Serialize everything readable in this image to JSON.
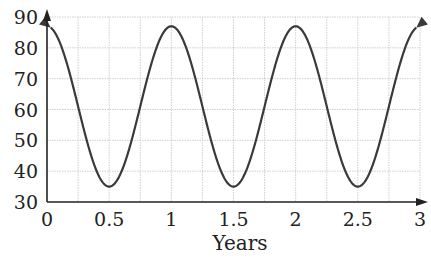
{
  "chart_data": {
    "type": "line",
    "title": "",
    "xlabel": "Years",
    "ylabel": "",
    "xlim": [
      0,
      3
    ],
    "ylim": [
      30,
      90
    ],
    "x_ticks": [
      "0",
      "0.5",
      "1",
      "1.5",
      "2",
      "2.5",
      "3"
    ],
    "y_ticks": [
      "30",
      "40",
      "50",
      "60",
      "70",
      "80",
      "90"
    ],
    "grid": true,
    "grid_x_step": 0.25,
    "grid_y_step": 10,
    "legend": null,
    "series": [
      {
        "name": "curve",
        "function": "y = 61 + 26*cos(2*pi*t)",
        "x": [
          0,
          0.25,
          0.5,
          0.75,
          1,
          1.25,
          1.5,
          1.75,
          2,
          2.25,
          2.5,
          2.75,
          3
        ],
        "values": [
          87,
          61,
          35,
          61,
          87,
          61,
          35,
          61,
          87,
          61,
          35,
          61,
          87
        ],
        "maxima": [
          {
            "x": 1,
            "y": 87
          },
          {
            "x": 2,
            "y": 87
          }
        ],
        "minima": [
          {
            "x": 0.5,
            "y": 35
          },
          {
            "x": 1.5,
            "y": 35
          },
          {
            "x": 2.5,
            "y": 35
          }
        ],
        "arrows_at_ends": true
      }
    ],
    "colors": {
      "curve": "#3a3a3a",
      "axis": "#222222",
      "grid": "#cfcfcf"
    }
  }
}
